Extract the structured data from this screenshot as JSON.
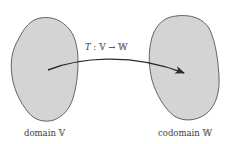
{
  "diagram": {
    "domain_label": "domain 𝕍",
    "codomain_label": "codomain 𝕎",
    "map_label": {
      "name": "T",
      "separator": " : ",
      "source": "𝕍",
      "arrow": " → ",
      "target": "𝕎"
    },
    "colors": {
      "set_fill": "#d4d4d4",
      "set_stroke": "#555555",
      "arrow": "#2a2a2a",
      "text": "#3a3a3a",
      "background": "#ffffff"
    }
  }
}
